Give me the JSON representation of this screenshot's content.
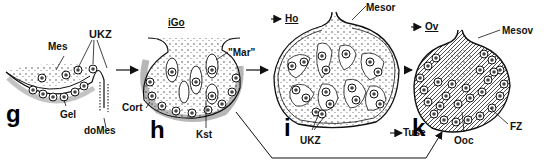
{
  "figure": {
    "stroke_color": "#111111",
    "background": "#ffffff"
  },
  "panels": [
    {
      "id": "g",
      "letter": "g",
      "labels": {
        "mesenchyme": "Mes",
        "germ_cells": "UKZ",
        "germinal_epithelium": "Gel",
        "dorsal_mesentery": "doMes"
      }
    },
    {
      "id": "h",
      "letter": "h",
      "labels": {
        "indifferent_gonad": "iGo",
        "medulla": "\"Mar\"",
        "cortex": "Cort",
        "sex_cords": "Kst"
      }
    },
    {
      "id": "i",
      "letter": "i",
      "labels": {
        "testis": "Ho",
        "mesorchium": "Mesor",
        "germ_cells": "UKZ",
        "tunica": "Tuse"
      }
    },
    {
      "id": "k",
      "letter": "k",
      "labels": {
        "ovary": "Ov",
        "mesovarium": "Mesov",
        "follicle_cells": "FZ",
        "oocytes": "Ooc"
      }
    }
  ],
  "arrows": [
    {
      "from": "g",
      "to": "h"
    },
    {
      "from": "h",
      "to": "i"
    },
    {
      "from": "i",
      "to": "k"
    },
    {
      "from": "h",
      "to": "k",
      "route": "below"
    }
  ]
}
